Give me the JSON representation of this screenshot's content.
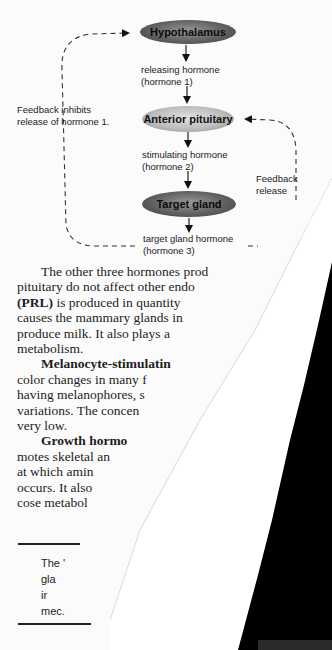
{
  "diagram": {
    "nodes": {
      "hypothalamus": "Hypothalamus",
      "anterior_pituitary": "Anterior pituitary",
      "target_gland": "Target gland"
    },
    "labels": {
      "hormone1_line1": "releasing hormone",
      "hormone1_line2": "(hormone 1)",
      "hormone2_line1": "stimulating hormone",
      "hormone2_line2": "(hormone 2)",
      "hormone3_line1": "target gland hormone",
      "hormone3_line2": "(hormone 3)"
    },
    "feedback_left": {
      "line1": "Feedback inhibits",
      "line2": "release of hormone 1."
    },
    "feedback_right": {
      "line1": "Feedback",
      "line2": "release"
    }
  },
  "left_page": {
    "lines": [
      "The other three hormones prod",
      "pituitary do not affect other endo",
      "is produced in quantity",
      "causes the mammary glands in",
      "produce milk. It also plays a",
      "metabolism.",
      "Melanocyte-stimulatin",
      "color changes in many f",
      "having melanophores, s",
      "variations. The concen",
      "very low.",
      "Growth hormo",
      "motes skeletal an",
      "at which amin",
      "occurs. It also",
      "cose metabol"
    ],
    "prl_bold": "(PRL)",
    "box": {
      "lines": [
        "The '",
        "gla",
        "ir",
        "mec."
      ]
    }
  },
  "right_page": {
    "lines": [
      "act",
      "of a",
      "incluc",
      "and m",
      "comple",
      "from ch",
      "The Acti",
      "secrete pe",
      "peptide ho",
      "what happ",
      "rine binds to",
      "In muscle ce",
      "breakdown o",
      "blood. The im",
      "cyclic adenosi",
      "contains one p",
      "two locations.",
      "AMP activates a",
      "this enzyme, in",
      "forth. The series o",
      "formation is calle",
      "enzyme can be used",
      "the cascade, more enz"
    ]
  }
}
